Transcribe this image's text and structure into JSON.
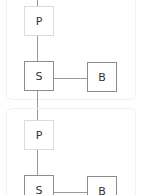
{
  "diagram": {
    "groups": [
      {
        "nodes": {
          "p": "P",
          "s": "S",
          "b": "B"
        }
      },
      {
        "nodes": {
          "p": "P",
          "s": "S",
          "b": "B"
        }
      }
    ]
  }
}
